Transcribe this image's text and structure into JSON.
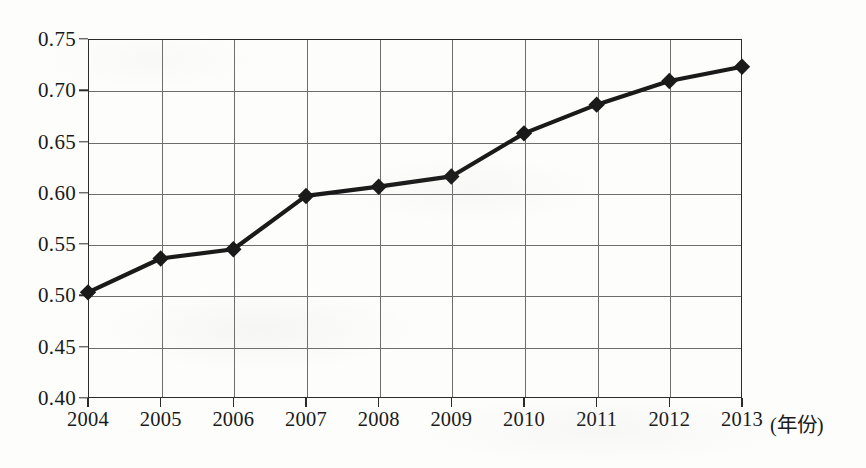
{
  "chart_data": {
    "type": "line",
    "title": "",
    "subtitle": "",
    "xlabel": "(年份)",
    "ylabel": "",
    "x": [
      2004,
      2005,
      2006,
      2007,
      2008,
      2009,
      2010,
      2011,
      2012,
      2013
    ],
    "categories": [
      "2004",
      "2005",
      "2006",
      "2007",
      "2008",
      "2009",
      "2010",
      "2011",
      "2012",
      "2013"
    ],
    "values": [
      0.503,
      0.536,
      0.545,
      0.597,
      0.606,
      0.616,
      0.658,
      0.686,
      0.709,
      0.723
    ],
    "series": [
      {
        "name": "",
        "values": [
          0.503,
          0.536,
          0.545,
          0.597,
          0.606,
          0.616,
          0.658,
          0.686,
          0.709,
          0.723
        ],
        "marker": "diamond",
        "color": "#1a1a1a",
        "line_width": 4
      }
    ],
    "ylim": [
      0.4,
      0.75
    ],
    "xlim": [
      2004,
      2013
    ],
    "ytick_labels": [
      "0.75",
      "0.70",
      "0.65",
      "0.60",
      "0.55",
      "0.50",
      "0.45",
      "0.40"
    ],
    "ytick_values": [
      0.75,
      0.7,
      0.65,
      0.6,
      0.55,
      0.5,
      0.45,
      0.4
    ],
    "ytick_step": 0.05,
    "grid": true,
    "grid_axis": "both",
    "grid_color": "#6e6e6e",
    "legend": false,
    "legend_position": "none",
    "annotations": [],
    "axis_color": "#2b2b2b",
    "background_color": "#fdfdfb"
  },
  "axis": {
    "x_unit_label": "(年份)"
  }
}
